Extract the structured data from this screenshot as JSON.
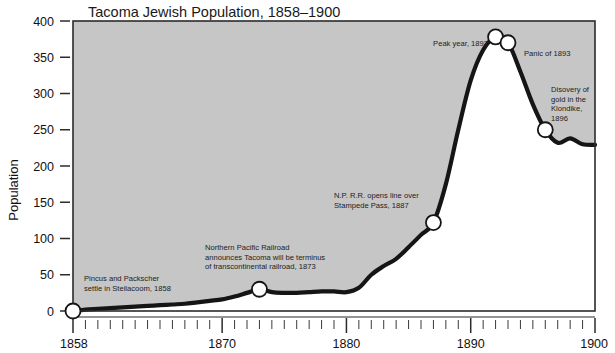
{
  "chart_data": {
    "type": "area",
    "title": "Tacoma Jewish Population, 1858–1900",
    "xlabel": "",
    "ylabel": "Population",
    "xlim": [
      1858,
      1900
    ],
    "ylim": [
      0,
      400
    ],
    "ytick_labels": [
      "0",
      "50",
      "100",
      "150",
      "200",
      "250",
      "300",
      "350",
      "400"
    ],
    "ytick_values": [
      0,
      50,
      100,
      150,
      200,
      250,
      300,
      350,
      400
    ],
    "xtick_labels": [
      "1858",
      "1870",
      "1880",
      "1890",
      "1900"
    ],
    "xtick_values": [
      1858,
      1870,
      1880,
      1890,
      1900
    ],
    "xtick_minor_step": 1,
    "grid": false,
    "legend": "none",
    "x": [
      1858,
      1859,
      1860,
      1861,
      1862,
      1863,
      1864,
      1865,
      1866,
      1867,
      1868,
      1869,
      1870,
      1871,
      1872,
      1873,
      1874,
      1875,
      1876,
      1877,
      1878,
      1879,
      1880,
      1881,
      1882,
      1883,
      1884,
      1885,
      1886,
      1887,
      1888,
      1889,
      1890,
      1891,
      1892,
      1893,
      1894,
      1895,
      1896,
      1897,
      1898,
      1899,
      1900
    ],
    "values": [
      0,
      2,
      3,
      4,
      5,
      6,
      7,
      8,
      9,
      10,
      12,
      14,
      16,
      20,
      25,
      30,
      26,
      25,
      25,
      26,
      27,
      27,
      26,
      32,
      50,
      62,
      72,
      88,
      105,
      122,
      175,
      250,
      318,
      360,
      378,
      370,
      330,
      285,
      250,
      232,
      238,
      230,
      229
    ],
    "markers": [
      {
        "x": 1858,
        "y": 0,
        "label": "start-1858"
      },
      {
        "x": 1873,
        "y": 30,
        "label": "railroad-terminus-1873"
      },
      {
        "x": 1887,
        "y": 122,
        "label": "stampede-pass-1887"
      },
      {
        "x": 1892,
        "y": 378,
        "label": "peak-year-1892"
      },
      {
        "x": 1893,
        "y": 370,
        "label": "panic-1893"
      },
      {
        "x": 1896,
        "y": 250,
        "label": "klondike-1896"
      }
    ],
    "annotations": [
      {
        "name": "annotation-steilacoom-1858",
        "lines": [
          "Pincus and Packscher",
          "settle in Steilacoom, 1858"
        ],
        "x": 84,
        "y": 281,
        "anchor": "start"
      },
      {
        "name": "annotation-northern-pacific-1873",
        "lines": [
          "Northern Pacific Railroad",
          "announces Tacoma will be terminus",
          "of transcontinental railroad, 1873"
        ],
        "x": 205,
        "y": 250,
        "anchor": "start"
      },
      {
        "name": "annotation-stampede-pass-1887",
        "lines": [
          "N.P. R.R. opens line over",
          "Stampede Pass, 1887"
        ],
        "x": 334,
        "y": 198,
        "anchor": "start"
      },
      {
        "name": "annotation-peak-year-1892",
        "lines": [
          "Peak year, 1892"
        ],
        "x": 488,
        "y": 46,
        "anchor": "end"
      },
      {
        "name": "annotation-panic-1893",
        "lines": [
          "Panic of 1893"
        ],
        "x": 524,
        "y": 56,
        "anchor": "start"
      },
      {
        "name": "annotation-klondike-1896",
        "lines": [
          "Disovery of",
          "gold in the",
          "Klondike,",
          "1896"
        ],
        "x": 551,
        "y": 92,
        "anchor": "start"
      }
    ],
    "colors": {
      "plot_background": "#c6c6c6",
      "area_under_curve": "#ffffff",
      "line": "#151515",
      "marker_fill": "#ffffff",
      "frame": "#2b2b2b",
      "text": "#111111",
      "page_background": "#ffffff"
    }
  }
}
